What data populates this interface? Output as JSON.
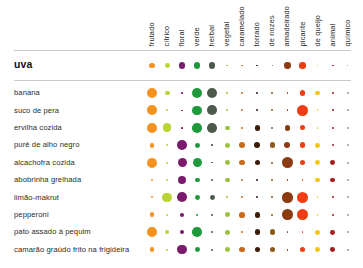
{
  "chart_data": {
    "type": "scatter",
    "title": "",
    "xlabel": "",
    "ylabel": "",
    "legend": "none",
    "grid": false,
    "categories": [
      "frutado",
      "cítrico",
      "floral",
      "verde",
      "herbal",
      "vegetal",
      "caramelado",
      "torrado",
      "de nozes",
      "amadeirado",
      "picante",
      "de queijo",
      "animal",
      "químico"
    ],
    "category_colors": [
      "#F5921E",
      "#BCD334",
      "#7B1B6E",
      "#1E9A3C",
      "#4C5A4C",
      "#9CC13B",
      "#C96B1E",
      "#3B1C08",
      "#8B5A1E",
      "#8B3A12",
      "#F23C12",
      "#F5C518",
      "#A31B1B",
      "#9B9B9B"
    ],
    "highlight_row": {
      "label": "uva",
      "values": [
        3,
        2.6,
        3.4,
        3.3,
        3.4,
        0.9,
        0.9,
        0.9,
        0.9,
        3.3,
        3.4,
        1.0,
        1.0,
        0.9
      ]
    },
    "rows": [
      {
        "label": "banana",
        "values": [
          5.4,
          2.6,
          0.8,
          5.2,
          5.4,
          1.0,
          1.0,
          1.0,
          1.0,
          1.0,
          2.8,
          2.6,
          1.0,
          1.0
        ]
      },
      {
        "label": "suco de pera",
        "values": [
          5.2,
          1.0,
          0.9,
          5.0,
          5.2,
          1.0,
          1.0,
          1.0,
          1.0,
          1.0,
          6.0,
          1.0,
          1.0,
          1.0
        ]
      },
      {
        "label": "ervilha cozida",
        "values": [
          5.2,
          4.6,
          0.9,
          5.0,
          5.2,
          2.4,
          1.0,
          3.0,
          1.0,
          3.0,
          2.8,
          1.0,
          1.0,
          1.0
        ]
      },
      {
        "label": "purê de alho negro",
        "values": [
          2.6,
          1.0,
          5.2,
          2.6,
          0.9,
          2.6,
          3.2,
          3.2,
          3.0,
          3.2,
          3.0,
          2.6,
          1.0,
          1.0
        ]
      },
      {
        "label": "alcachofra cozida",
        "values": [
          5.2,
          1.0,
          4.8,
          4.8,
          0.9,
          2.6,
          3.0,
          3.0,
          1.0,
          5.8,
          3.0,
          2.6,
          2.6,
          1.0
        ]
      },
      {
        "label": "abobrinha grelhada",
        "values": [
          1.0,
          1.0,
          4.6,
          2.6,
          1.0,
          2.4,
          1.0,
          1.0,
          1.0,
          1.0,
          1.0,
          2.6,
          2.6,
          1.0
        ]
      },
      {
        "label": "limão-makrut",
        "values": [
          1.0,
          5.0,
          5.2,
          2.6,
          2.6,
          1.0,
          1.0,
          1.0,
          1.0,
          5.4,
          6.0,
          1.0,
          1.0,
          1.0
        ]
      },
      {
        "label": "pepperoni",
        "values": [
          2.6,
          1.0,
          2.4,
          1.0,
          1.0,
          2.6,
          3.0,
          3.0,
          1.0,
          5.6,
          5.8,
          1.0,
          1.0,
          1.0
        ]
      },
      {
        "label": "pato assado à pequim",
        "values": [
          5.0,
          2.4,
          2.4,
          5.0,
          1.0,
          2.6,
          1.0,
          3.0,
          3.0,
          1.0,
          1.0,
          2.6,
          2.6,
          1.0
        ]
      },
      {
        "label": "camarão graúdo frito na frigideira",
        "values": [
          2.6,
          1.0,
          5.0,
          2.6,
          1.0,
          2.6,
          3.0,
          3.0,
          3.0,
          1.0,
          3.0,
          2.6,
          2.6,
          1.0
        ]
      }
    ]
  }
}
